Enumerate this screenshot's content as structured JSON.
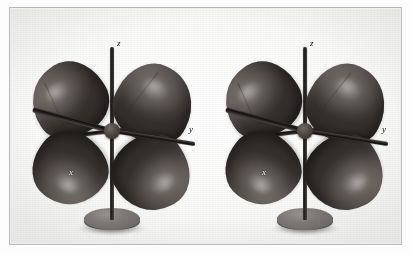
{
  "figure": {
    "kind": "photograph",
    "background_color": "#fdfdfd",
    "frame_color": "#b8b8b8",
    "model_color": "#56514c",
    "rod_color": "#1d1b19",
    "stand_color": "#6d6964"
  },
  "models": [
    {
      "id": "left-model",
      "name": "orbital-model-left",
      "lobe_count": 4,
      "lobes": [
        {
          "id": "upper-left-lobe"
        },
        {
          "id": "upper-right-lobe"
        },
        {
          "id": "lower-left-lobe"
        },
        {
          "id": "lower-right-lobe"
        }
      ],
      "axes": [
        {
          "id": "z",
          "label": "z"
        },
        {
          "id": "y",
          "label": "y"
        },
        {
          "id": "x",
          "label": "x"
        }
      ],
      "stand": {
        "id": "disc-stand"
      }
    },
    {
      "id": "right-model",
      "name": "orbital-model-right",
      "lobe_count": 4,
      "lobes": [
        {
          "id": "upper-left-lobe"
        },
        {
          "id": "upper-right-lobe"
        },
        {
          "id": "lower-left-lobe"
        },
        {
          "id": "lower-right-lobe"
        }
      ],
      "axes": [
        {
          "id": "z",
          "label": "z"
        },
        {
          "id": "y",
          "label": "y"
        },
        {
          "id": "x",
          "label": "x"
        }
      ],
      "stand": {
        "id": "disc-stand"
      }
    }
  ]
}
